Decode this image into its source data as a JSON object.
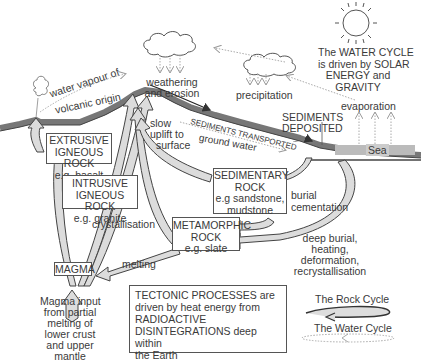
{
  "water_cycle_note": [
    "The WATER CYCLE",
    "is driven by SOLAR",
    "ENERGY and",
    "GRAVITY"
  ],
  "labels": {
    "water_vapour": "water vapour of",
    "volcanic_origin": "volcanic origin",
    "weathering": "weathering",
    "erosion": "and erosion",
    "precipitation": "precipitation",
    "evaporation": "evaporation",
    "sediments_deposited": [
      "SEDIMENTS",
      "DEPOSITED"
    ],
    "sediments_transported": "SEDIMENTS TRANSPORTED",
    "ground_water": "ground water",
    "sea": "Sea",
    "slow_uplift": [
      "slow",
      "uplift to",
      "surface"
    ],
    "burial_cementation": [
      "burial",
      "cementation"
    ],
    "crystallisation": "crystallisation",
    "melting": "melting",
    "deep_burial": [
      "deep burial,",
      "heating,",
      "deformation,",
      "recrystallisation"
    ],
    "magma_input": [
      "Magma input",
      "from partial",
      "melting of",
      "lower crust",
      "and upper",
      "mantle"
    ]
  },
  "boxes": {
    "extrusive": [
      "EXTRUSIVE",
      "IGNEOUS ROCK",
      "e.g. basalt"
    ],
    "intrusive": [
      "INTRUSIVE",
      "IGNEOUS ROCK",
      "e.g. granite"
    ],
    "sedimentary": [
      "SEDIMENTARY",
      "ROCK",
      "e.g sandstone,",
      "mudstone"
    ],
    "metamorphic": [
      "METAMORPHIC",
      "ROCK",
      "e.g. slate"
    ],
    "magma": "MAGMA",
    "tectonic": [
      "TECTONIC PROCESSES are",
      "driven by heat energy from",
      "RADIOACTIVE",
      "DISINTEGRATIONS deep within",
      "the Earth"
    ]
  },
  "legend": {
    "rock_cycle": "The Rock Cycle",
    "water_cycle": "The Water Cycle"
  },
  "colors": {
    "land": "#8a8a8a",
    "land_dark": "#555555",
    "sea": "#b5b5b5",
    "arrow_fill": "#d8d8d8",
    "arrow_stroke": "#444444",
    "water_arrow": "#aaaaaa"
  }
}
